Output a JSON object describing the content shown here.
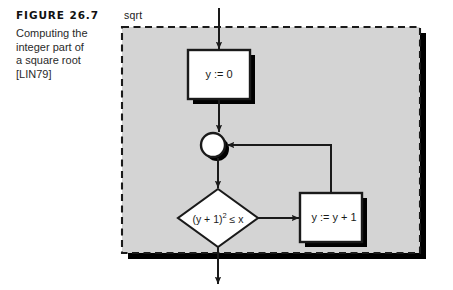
{
  "figure": {
    "number_label": "FIGURE 26.7",
    "caption_lines": [
      "Computing the",
      "integer part of",
      "a square root",
      "[LIN79]"
    ]
  },
  "diagram": {
    "type": "flowchart",
    "container_label": "sqrt",
    "container_style": "dashed-rectangle-with-drop-shadow",
    "background_fill": "#d4d4d4",
    "node_fill": "#ffffff",
    "stroke_color": "#1a1a1a",
    "shadow_color": "#000000",
    "nodes": [
      {
        "id": "init",
        "shape": "process-box",
        "label": "y := 0",
        "x": 188,
        "y": 50,
        "width": 62,
        "height": 49
      },
      {
        "id": "merge",
        "shape": "circle-junction",
        "label": "",
        "cx": 213,
        "cy": 145,
        "r": 12
      },
      {
        "id": "decision",
        "shape": "diamond",
        "label_html": "(y + 1)<sup>2</sup> &#8804; x",
        "label_plain": "(y + 1)2 ≤ x",
        "cx": 218,
        "cy": 218,
        "rx": 40,
        "ry": 29
      },
      {
        "id": "increment",
        "shape": "process-box",
        "label": "y := y + 1",
        "x": 300,
        "y": 193,
        "width": 62,
        "height": 49
      }
    ],
    "edges": [
      {
        "from": "entry",
        "to": "init",
        "kind": "arrow-down"
      },
      {
        "from": "init",
        "to": "merge",
        "kind": "arrow-down"
      },
      {
        "from": "merge",
        "to": "decision",
        "kind": "arrow-down"
      },
      {
        "from": "decision",
        "to": "increment",
        "kind": "arrow-right"
      },
      {
        "from": "increment",
        "to": "merge",
        "kind": "loop-back-up-then-left"
      },
      {
        "from": "decision",
        "to": "exit",
        "kind": "arrow-down-through-border"
      }
    ]
  }
}
